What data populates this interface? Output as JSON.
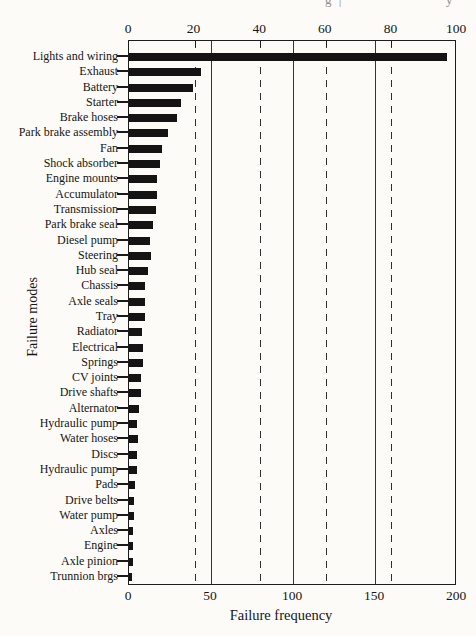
{
  "page": {
    "artifacts": [
      "g  |",
      "y"
    ]
  },
  "chart_data": {
    "type": "bar",
    "orientation": "horizontal",
    "title": "",
    "xlabel": "Failure frequency",
    "ylabel": "Failure modes",
    "bar_color": "#141414",
    "axis_color": "#1c1c1c",
    "legend": "none",
    "top_axis": {
      "range": [
        0,
        100
      ],
      "ticks": [
        0,
        20,
        40,
        60,
        80,
        100
      ]
    },
    "bottom_axis": {
      "range": [
        0,
        200
      ],
      "ticks": [
        0,
        50,
        100,
        150,
        200
      ]
    },
    "gridlines": {
      "scale": "bottom",
      "solid_at": [
        50,
        100,
        150
      ],
      "dashed_at": [
        40,
        80,
        120,
        160
      ]
    },
    "categories": [
      "Lights and wiring",
      "Exhaust",
      "Battery",
      "Starter",
      "Brake hoses",
      "Park brake assembly",
      "Fan",
      "Shock absorber",
      "Engine mounts",
      "Accumulator",
      "Transmission",
      "Park brake seal",
      "Diesel pump",
      "Steering",
      "Hub seal",
      "Chassis",
      "Axle seals",
      "Tray",
      "Radiator",
      "Electrical",
      "Springs",
      "CV joints",
      "Drive shafts",
      "Alternator",
      "Hydraulic pump",
      "Water hoses",
      "Discs",
      "Hydraulic pump",
      "Pads",
      "Drive belts",
      "Water pump",
      "Axles",
      "Engine",
      "Axle pinion",
      "Trunnion brgs"
    ],
    "values": [
      194,
      44,
      39,
      32,
      29,
      24,
      20,
      19,
      17,
      17,
      16.5,
      14.5,
      13,
      13.5,
      11.5,
      10,
      9.5,
      10,
      8,
      8.5,
      8.5,
      7.5,
      7.5,
      6,
      5,
      5.5,
      5,
      5,
      3.5,
      3,
      3,
      2.5,
      2.5,
      2.5,
      2
    ]
  }
}
